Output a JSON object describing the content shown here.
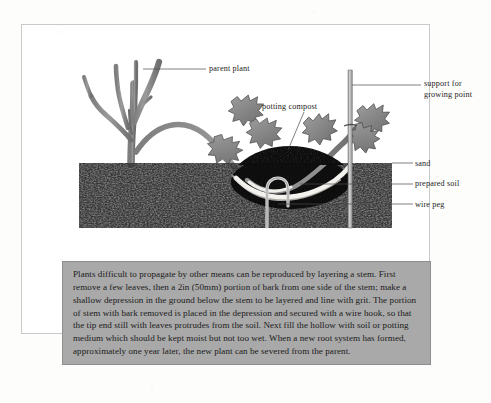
{
  "page": {
    "kind": "book-page-scan",
    "figure_title": "Layering propagation diagram"
  },
  "diagram": {
    "labels": {
      "parent_plant": "parent plant",
      "potting_compost": "potting compost",
      "support_line1": "support for",
      "support_line2": "growing point",
      "sand": "sand",
      "prepared_soil": "prepared soil",
      "wire_peg": "wire peg"
    },
    "colors": {
      "soil": "#3d3d3d",
      "compost": "#141414",
      "sand": "#f2f0ec",
      "stem": "#8f8f8f",
      "leaf": "#8a8a8a",
      "stake": "#b5b5b5",
      "leader_line": "#4a4a4a",
      "caption_background": "#a9a9a9",
      "page_border": "#c9c9c9"
    }
  },
  "caption": {
    "text": "Plants difficult to propagate by other means can be reproduced by layering a stem. First remove a few leaves, then a 2in (50mm) portion of bark from one side of the stem; make a shallow depression in the ground below the stem to be layered and line with grit. The portion of stem with bark removed is placed in the depression and secured with a wire hook, so that the tip end still with leaves protrudes from the soil. Next fill the hollow with soil or potting medium which should be kept moist but not too wet. When a new root system has formed, approximately one year later, the new plant can be severed from the parent."
  }
}
